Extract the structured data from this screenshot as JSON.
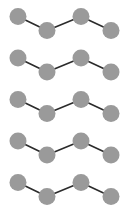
{
  "figure": {
    "width": 129,
    "height": 213,
    "background_color": "#ffffff",
    "node_color": "#9a9a9a",
    "link_color": "#2b2b2b",
    "node_radius": 8.5,
    "link_width": 1.6,
    "row_count": 5,
    "nodes_per_row": 4,
    "links_per_row": 3,
    "row_spacing": 41.5,
    "row_labels": [
      "row-1",
      "row-2",
      "row-3",
      "row-4",
      "row-5"
    ],
    "node_labels": [
      "node-a",
      "node-b",
      "node-c",
      "node-d"
    ],
    "rows": [
      {
        "name": "row-1",
        "y_offset": 0,
        "nodes": [
          {
            "name": "node-a",
            "x": 18,
            "y": 16.5
          },
          {
            "name": "node-b",
            "x": 47,
            "y": 30.5
          },
          {
            "name": "node-c",
            "x": 81,
            "y": 16.5
          },
          {
            "name": "node-d",
            "x": 111,
            "y": 30.5
          }
        ],
        "links": [
          {
            "name": "link-ab",
            "from": "node-a",
            "to": "node-b"
          },
          {
            "name": "link-bc",
            "from": "node-b",
            "to": "node-c"
          },
          {
            "name": "link-cd",
            "from": "node-c",
            "to": "node-d"
          }
        ]
      },
      {
        "name": "row-2",
        "y_offset": 41.5,
        "nodes": [
          {
            "name": "node-a",
            "x": 18,
            "y": 58
          },
          {
            "name": "node-b",
            "x": 47,
            "y": 72
          },
          {
            "name": "node-c",
            "x": 81,
            "y": 58
          },
          {
            "name": "node-d",
            "x": 111,
            "y": 72
          }
        ],
        "links": [
          {
            "name": "link-ab",
            "from": "node-a",
            "to": "node-b"
          },
          {
            "name": "link-bc",
            "from": "node-b",
            "to": "node-c"
          },
          {
            "name": "link-cd",
            "from": "node-c",
            "to": "node-d"
          }
        ]
      },
      {
        "name": "row-3",
        "y_offset": 83,
        "nodes": [
          {
            "name": "node-a",
            "x": 18,
            "y": 99.5
          },
          {
            "name": "node-b",
            "x": 47,
            "y": 113.5
          },
          {
            "name": "node-c",
            "x": 81,
            "y": 99.5
          },
          {
            "name": "node-d",
            "x": 111,
            "y": 113.5
          }
        ],
        "links": [
          {
            "name": "link-ab",
            "from": "node-a",
            "to": "node-b"
          },
          {
            "name": "link-bc",
            "from": "node-b",
            "to": "node-c"
          },
          {
            "name": "link-cd",
            "from": "node-c",
            "to": "node-d"
          }
        ]
      },
      {
        "name": "row-4",
        "y_offset": 124.5,
        "nodes": [
          {
            "name": "node-a",
            "x": 18,
            "y": 141
          },
          {
            "name": "node-b",
            "x": 47,
            "y": 155
          },
          {
            "name": "node-c",
            "x": 81,
            "y": 141
          },
          {
            "name": "node-d",
            "x": 111,
            "y": 155
          }
        ],
        "links": [
          {
            "name": "link-ab",
            "from": "node-a",
            "to": "node-b"
          },
          {
            "name": "link-bc",
            "from": "node-b",
            "to": "node-c"
          },
          {
            "name": "link-cd",
            "from": "node-c",
            "to": "node-d"
          }
        ]
      },
      {
        "name": "row-5",
        "y_offset": 166,
        "nodes": [
          {
            "name": "node-a",
            "x": 18,
            "y": 182.5
          },
          {
            "name": "node-b",
            "x": 47,
            "y": 196.5
          },
          {
            "name": "node-c",
            "x": 81,
            "y": 182.5
          },
          {
            "name": "node-d",
            "x": 111,
            "y": 196.5
          }
        ],
        "links": [
          {
            "name": "link-ab",
            "from": "node-a",
            "to": "node-b"
          },
          {
            "name": "link-bc",
            "from": "node-b",
            "to": "node-c"
          },
          {
            "name": "link-cd",
            "from": "node-c",
            "to": "node-d"
          }
        ]
      }
    ]
  }
}
